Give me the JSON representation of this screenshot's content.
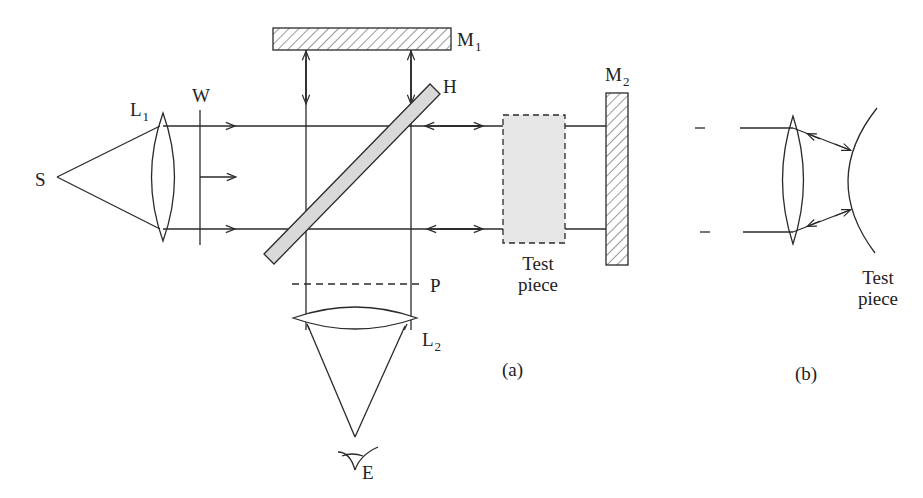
{
  "diagram": {
    "type": "optical-interferometer-schematic",
    "labels": {
      "source": "S",
      "lens1": {
        "main": "L",
        "sub": "1"
      },
      "wavefront": "W",
      "mirror1": {
        "main": "M",
        "sub": "1"
      },
      "beamsplitter": "H",
      "mirror2": {
        "main": "M",
        "sub": "2"
      },
      "plane": "P",
      "lens2": {
        "main": "L",
        "sub": "2"
      },
      "eye": "E",
      "test_piece_a": {
        "line1": "Test",
        "line2": "piece"
      },
      "test_piece_b": {
        "line1": "Test",
        "line2": "piece"
      },
      "panel_a": "(a)",
      "panel_b": "(b)"
    },
    "colors": {
      "line": "#2a2a2a",
      "fill_gray": "#d9d9d9",
      "test_piece_fill": "#e6e6e6",
      "background": "#ffffff"
    }
  }
}
